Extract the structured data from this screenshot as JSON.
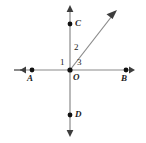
{
  "figure": {
    "type": "geometry-diagram",
    "background_color": "#ffffff",
    "line_color": "#7d7d7d",
    "text_color": "#1c1c1c",
    "point_color": "#000000",
    "width": 146,
    "height": 143,
    "vertex": {
      "label": "O",
      "x": 70,
      "y": 70
    },
    "points": [
      {
        "name": "point-a",
        "label": "A",
        "x": 32,
        "y": 70,
        "label_x": 28,
        "label_y": 74
      },
      {
        "name": "point-b",
        "label": "B",
        "x": 126,
        "y": 70,
        "label_x": 122,
        "label_y": 74
      },
      {
        "name": "point-c",
        "label": "C",
        "x": 70,
        "y": 24,
        "label_x": 75,
        "label_y": 20
      },
      {
        "name": "point-d",
        "label": "D",
        "x": 70,
        "y": 115,
        "label_x": 75,
        "label_y": 111
      },
      {
        "name": "point-o",
        "label": "O",
        "x": 70,
        "y": 70,
        "label_x": 73,
        "label_y": 73
      }
    ],
    "angles": [
      {
        "name": "angle-1",
        "label": "1",
        "label_x": 60,
        "label_y": 59
      },
      {
        "name": "angle-2",
        "label": "2",
        "label_x": 74,
        "label_y": 44
      },
      {
        "name": "angle-3",
        "label": "3",
        "label_x": 77,
        "label_y": 59
      }
    ],
    "lines": [
      {
        "name": "horizontal-line",
        "x1": 14,
        "y1": 70,
        "x2": 135,
        "y2": 70,
        "arrows": "both"
      },
      {
        "name": "vertical-line",
        "x1": 70,
        "y1": 5,
        "x2": 70,
        "y2": 137,
        "arrows": "both"
      },
      {
        "name": "ray-from-origin",
        "x1": 70,
        "y1": 70,
        "x2": 116,
        "y2": 11,
        "arrows": "end"
      }
    ]
  }
}
